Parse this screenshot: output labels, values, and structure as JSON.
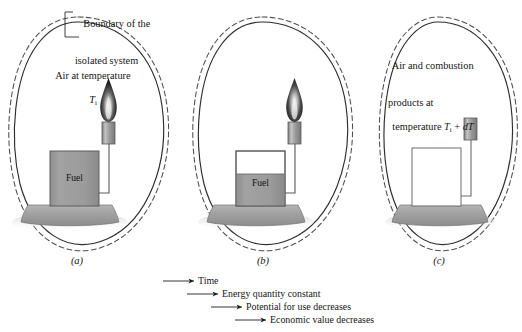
{
  "figure": {
    "type": "diagram",
    "background_color": "#ffffff",
    "ink_color": "#161616",
    "fill_gray": "#9a9a9a",
    "base_gray": "#a6a6a6",
    "flame_color": "#151515"
  },
  "annotations": {
    "boundary_label_line1": "Boundary of the",
    "boundary_label_line2": "isolated system"
  },
  "panels": [
    {
      "id": "a",
      "label": "(a)",
      "caption_line1": "Air at temperature",
      "caption_symbol_base": "T",
      "caption_symbol_sub": "i",
      "tank_label": "Fuel",
      "fuel_fill_percent": 100,
      "flame": true
    },
    {
      "id": "b",
      "label": "(b)",
      "tank_label": "Fuel",
      "fuel_fill_percent": 58,
      "flame": true
    },
    {
      "id": "c",
      "label": "(c)",
      "caption_line1": "Air and combustion",
      "caption_line2": "products at",
      "caption_line3_prefix": "temperature ",
      "caption_symbol_base": "T",
      "caption_symbol_sub": "i",
      "caption_line3_suffix": " + ",
      "caption_symbol_diff": "dT",
      "tank_label": "",
      "fuel_fill_percent": 0,
      "flame": false
    }
  ],
  "legend": {
    "items": [
      {
        "arrow": "arrow-right-icon",
        "text": "Time"
      },
      {
        "arrow": "arrow-right-icon",
        "text": "Energy quantity constant"
      },
      {
        "arrow": "arrow-right-icon",
        "text": "Potential for use decreases"
      },
      {
        "arrow": "arrow-right-icon",
        "text": "Economic value decreases"
      }
    ]
  }
}
